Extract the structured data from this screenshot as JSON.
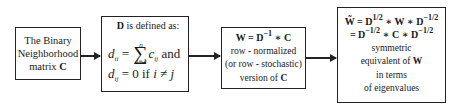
{
  "diagram": {
    "type": "flowchart",
    "direction": "left-to-right",
    "nodes": [
      {
        "id": "binary-matrix",
        "lines": [
          "The Binary",
          "Neighborhood",
          "matrix C"
        ]
      },
      {
        "id": "d-definition",
        "title": "D is defined as:",
        "eq1": "d_ii = Σ_{j=1}^{n} c_ij and",
        "eq2": "d_ij = 0 if i ≠ j"
      },
      {
        "id": "row-normalized",
        "formula": "W = D^-1 * C",
        "lines": [
          "row - normalized",
          "(or row - stochastic)",
          "version of C"
        ]
      },
      {
        "id": "symmetric",
        "formula1": "W̃ = D^1/2 * W * D^-1/2",
        "formula2": "= D^-1/2 * C * D^-1/2",
        "lines": [
          "symmetric",
          "equivalent of W",
          "in terms",
          "of eigenvalues"
        ]
      }
    ],
    "edges": [
      {
        "from": "binary-matrix",
        "to": "d-definition"
      },
      {
        "from": "d-definition",
        "to": "row-normalized"
      },
      {
        "from": "row-normalized",
        "to": "symmetric"
      }
    ]
  },
  "labels": {
    "b1_l1": "The Binary",
    "b1_l2": "Neighborhood",
    "b1_l3": "matrix ",
    "b1_C": "C",
    "b2_D": "D",
    "b2_title_rest": " is defined as:",
    "b2_d": "d",
    "b2_ii": "ii",
    "b2_eq": " = ",
    "b2_n": "n",
    "b2_lo": "j=1",
    "b2_c": "c",
    "b2_ij": "ij",
    "b2_and": " and",
    "b2_zero": "0",
    "b2_if": " if ",
    "b2_i": "i",
    "b2_neq": " ≠ ",
    "b2_j": "j",
    "b3_f": "W = D",
    "b3_exp": "−1",
    "b3_f2": " ∗ C",
    "b3_l1": "row - normalized",
    "b3_l2": "(or row - stochastic)",
    "b3_l3a": "version of ",
    "b3_l3b": "C",
    "b4_Wt": "W̃",
    "b4_eq": " = D",
    "b4_half": "1/2",
    "b4_mid": " ∗ W ∗ D",
    "b4_mhalf": "−1/2",
    "b4_l2a": "= D",
    "b4_l2b": " ∗ C ∗ D",
    "b4_l3": "symmetric",
    "b4_l4a": "equivalent of ",
    "b4_l4b": "W",
    "b4_l5": "in terms",
    "b4_l6": "of eigenvalues"
  }
}
